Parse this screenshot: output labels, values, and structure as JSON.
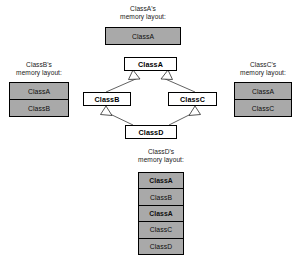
{
  "diagram": {
    "type": "uml-class-diagram-with-memory-layouts",
    "colors": {
      "memory_fill": "#a9a9a9",
      "node_fill": "#ffffff",
      "border": "#000000",
      "edge": "#3a3a3a",
      "background": "#ffffff"
    },
    "nodes": [
      {
        "id": "ClassA",
        "label": "ClassA"
      },
      {
        "id": "ClassB",
        "label": "ClassB"
      },
      {
        "id": "ClassC",
        "label": "ClassC"
      },
      {
        "id": "ClassD",
        "label": "ClassD"
      }
    ],
    "edges": [
      {
        "from": "ClassB",
        "to": "ClassA",
        "kind": "generalization"
      },
      {
        "from": "ClassC",
        "to": "ClassA",
        "kind": "generalization"
      },
      {
        "from": "ClassD",
        "to": "ClassB",
        "kind": "generalization"
      },
      {
        "from": "ClassD",
        "to": "ClassC",
        "kind": "generalization"
      }
    ],
    "memory_layouts": [
      {
        "id": "classA-layout",
        "caption_line1": "ClassA's",
        "caption_line2": "memory layout:",
        "rows": [
          {
            "label": "ClassA",
            "bold": false
          }
        ]
      },
      {
        "id": "classB-layout",
        "caption_line1": "ClassB's",
        "caption_line2": "memory layout:",
        "rows": [
          {
            "label": "ClassA",
            "bold": false
          },
          {
            "label": "ClassB",
            "bold": false
          }
        ]
      },
      {
        "id": "classC-layout",
        "caption_line1": "ClassC's",
        "caption_line2": "memory layout:",
        "rows": [
          {
            "label": "ClassA",
            "bold": false
          },
          {
            "label": "ClassC",
            "bold": false
          }
        ]
      },
      {
        "id": "classD-layout",
        "caption_line1": "ClassD's",
        "caption_line2": "memory layout:",
        "rows": [
          {
            "label": "ClassA",
            "bold": true
          },
          {
            "label": "ClassB",
            "bold": false
          },
          {
            "label": "ClassA",
            "bold": true
          },
          {
            "label": "ClassC",
            "bold": false
          },
          {
            "label": "ClassD",
            "bold": false
          }
        ]
      }
    ]
  }
}
